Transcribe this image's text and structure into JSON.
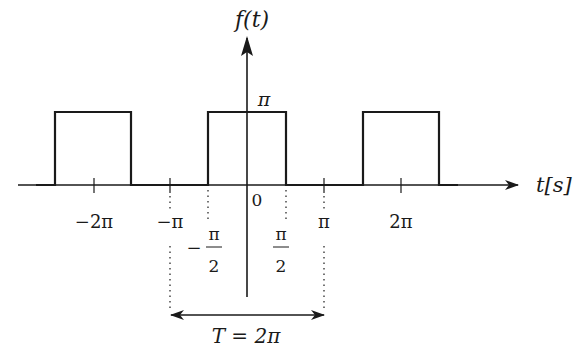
{
  "diagram": {
    "type": "periodic rectangular pulse train",
    "y_axis_label": "f(t)",
    "x_axis_label": "t[s]",
    "amplitude_label": "π",
    "origin_label": "0",
    "x_tick_labels": [
      "−2π",
      "−π",
      "π",
      "2π"
    ],
    "half_width_labels": {
      "neg": {
        "sign": "−",
        "num": "π",
        "den": "2"
      },
      "pos": {
        "num": "π",
        "den": "2"
      }
    },
    "period_label": "T = 2π",
    "pulses": [
      {
        "start": "-5π/2",
        "end": "-3π/2",
        "height": "π"
      },
      {
        "start": "-π/2",
        "end": "π/2",
        "height": "π"
      },
      {
        "start": "3π/2",
        "end": "5π/2",
        "height": "π"
      }
    ],
    "line_color": "#1a1a1a"
  }
}
